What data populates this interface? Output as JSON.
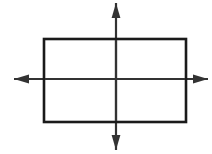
{
  "canvas": {
    "width": 212,
    "height": 154,
    "background": "#ffffff",
    "title": "Rectangle with horizontal and vertical axes of symmetry"
  },
  "figure": {
    "type": "geometry-diagram",
    "stroke_color": "#1a1a1a",
    "axis_color": "#333333",
    "fill": "none"
  },
  "rectangle": {
    "name": "rectangle",
    "x": 44,
    "y": 39,
    "width": 142,
    "height": 83,
    "stroke_width": 2.6,
    "stroke": "#1a1a1a",
    "fill": "none",
    "center_x": 115,
    "center_y": 80.5
  },
  "axes": {
    "vertical": {
      "name": "vertical-axis",
      "label": "vertical line of symmetry",
      "x": 116,
      "y_start": 3,
      "y_end": 150,
      "stroke_width": 2.2,
      "stroke": "#333333",
      "arrow_start": true,
      "arrow_end": true
    },
    "horizontal": {
      "name": "horizontal-axis",
      "label": "horizontal line of symmetry",
      "y": 79,
      "x_start": 14,
      "x_end": 208,
      "stroke_width": 2.2,
      "stroke": "#333333",
      "arrow_start": true,
      "arrow_end": true
    }
  },
  "arrowheads": {
    "length": 15,
    "half_width": 4.4,
    "fill": "#333333",
    "items": [
      {
        "name": "arrowhead-up",
        "direction": "up",
        "tip_x": 116,
        "tip_y": 3
      },
      {
        "name": "arrowhead-down",
        "direction": "down",
        "tip_x": 116,
        "tip_y": 150
      },
      {
        "name": "arrowhead-left",
        "direction": "left",
        "tip_x": 14,
        "tip_y": 79
      },
      {
        "name": "arrowhead-right",
        "direction": "right",
        "tip_x": 208,
        "tip_y": 79
      }
    ]
  },
  "chart_data": {
    "type": "diagram",
    "title": "",
    "shapes": [
      {
        "kind": "rectangle",
        "x": 44,
        "y": 39,
        "width": 142,
        "height": 83
      },
      {
        "kind": "double-arrow",
        "orientation": "vertical",
        "from": [
          116,
          3
        ],
        "to": [
          116,
          150
        ]
      },
      {
        "kind": "double-arrow",
        "orientation": "horizontal",
        "from": [
          14,
          79
        ],
        "to": [
          208,
          79
        ]
      }
    ]
  }
}
